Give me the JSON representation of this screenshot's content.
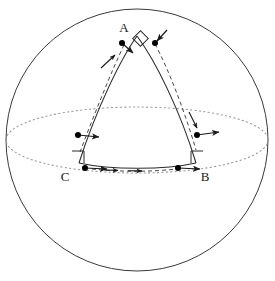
{
  "figure": {
    "background_color": "#ffffff",
    "stroke_color": "#2b2b2b",
    "dot_color": "#000000",
    "dotted_color": "#8a8a8a",
    "sphere": {
      "name": "sphere-outline",
      "center_x": 137,
      "center_y": 140,
      "radius": 131
    },
    "equator": {
      "name": "equator-ellipse",
      "center_x": 137,
      "center_y": 140,
      "rx": 131,
      "ry": 33,
      "style": "dotted"
    },
    "vertices": [
      {
        "id": "A",
        "label": "A",
        "label_x": 124,
        "label_y": 32,
        "point_x": 137,
        "point_y": 35
      },
      {
        "id": "B",
        "label": "B",
        "label_x": 203,
        "label_y": 180,
        "point_x": 196,
        "point_y": 162
      },
      {
        "id": "C",
        "label": "C",
        "label_x": 63,
        "label_y": 180,
        "point_x": 78,
        "point_y": 162
      }
    ],
    "right_angle_markers": [
      {
        "name": "right-angle-marker-apex",
        "x": 140,
        "y": 38,
        "size": 11,
        "rotated": true
      },
      {
        "name": "right-angle-marker-c",
        "x": 79,
        "y": 152,
        "size": 11,
        "rotated": false
      },
      {
        "name": "right-angle-marker-b",
        "x": 190,
        "y": 152,
        "size": 11,
        "rotated": false
      }
    ],
    "transport_dots": [
      {
        "name": "dot-apex-left",
        "x": 122,
        "y": 43
      },
      {
        "name": "dot-apex-right",
        "x": 155,
        "y": 43
      },
      {
        "name": "dot-meridian-left",
        "x": 78,
        "y": 135
      },
      {
        "name": "dot-meridian-right",
        "x": 197,
        "y": 135
      },
      {
        "name": "dot-base-left",
        "x": 85,
        "y": 168
      },
      {
        "name": "dot-base-right",
        "x": 178,
        "y": 168
      }
    ],
    "transport_vectors": [
      {
        "name": "vector-apex-left",
        "x1": 122,
        "y1": 43,
        "x2": 134,
        "y2": 54
      },
      {
        "name": "vector-apex-right",
        "x1": 166,
        "y1": 30,
        "x2": 155,
        "y2": 42
      },
      {
        "name": "vector-meridian-left",
        "x1": 78,
        "y1": 135,
        "x2": 99,
        "y2": 137
      },
      {
        "name": "vector-meridian-right",
        "x1": 197,
        "y1": 135,
        "x2": 218,
        "y2": 132
      },
      {
        "name": "vector-base-left",
        "x1": 85,
        "y1": 168,
        "x2": 107,
        "y2": 169
      },
      {
        "name": "vector-base-right",
        "x1": 178,
        "y1": 168,
        "x2": 199,
        "y2": 169
      },
      {
        "name": "vector-left-arc-travel",
        "x1": 102,
        "y1": 67,
        "x2": 116,
        "y2": 54
      },
      {
        "name": "vector-right-arc-travel",
        "x1": 190,
        "y1": 113,
        "x2": 198,
        "y2": 128
      }
    ],
    "edges": [
      {
        "name": "edge-a-to-c",
        "style": "solid"
      },
      {
        "name": "edge-a-to-b",
        "style": "solid"
      },
      {
        "name": "edge-c-to-b",
        "style": "solid"
      }
    ],
    "transport_paths": [
      {
        "name": "transport-path-left-meridian",
        "style": "dashed"
      },
      {
        "name": "transport-path-right-meridian",
        "style": "dashed"
      },
      {
        "name": "transport-path-base",
        "style": "dashed"
      }
    ]
  }
}
